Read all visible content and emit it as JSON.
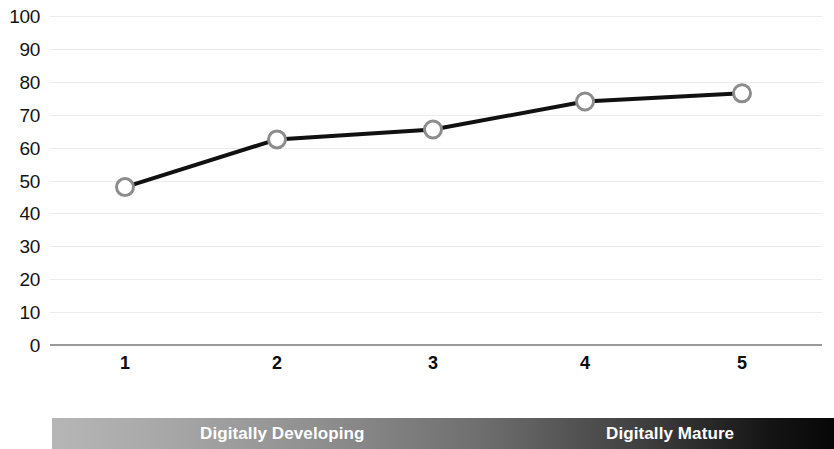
{
  "chart_data": {
    "type": "line",
    "title": "",
    "subtitle": "",
    "xlabel": "",
    "ylabel": "",
    "x": [
      1,
      2,
      3,
      4,
      5
    ],
    "categories": [
      "1",
      "2",
      "3",
      "4",
      "5"
    ],
    "values": [
      48,
      62.5,
      65.5,
      74,
      76.5
    ],
    "series": [
      {
        "name": "",
        "values": [
          48,
          62.5,
          65.5,
          74,
          76.5
        ]
      }
    ],
    "ylim": [
      0,
      100
    ],
    "yticks": [
      0,
      10,
      20,
      30,
      40,
      50,
      60,
      70,
      80,
      90,
      100
    ],
    "ytick_labels": [
      "0",
      "10",
      "20",
      "30",
      "40",
      "50",
      "60",
      "70",
      "80",
      "90",
      "100"
    ],
    "xtick_labels": [
      "1",
      "2",
      "3",
      "4",
      "5"
    ],
    "grid": true,
    "grid_axis": "y",
    "legend": false,
    "legend_position": "none",
    "marker": "circle-open",
    "line_color": "#111111",
    "marker_fill": "#ffffff",
    "marker_edge": "#8c8c8c",
    "grid_color": "#ececec",
    "axis_color": "#9a9a9a",
    "annotations": [
      {
        "text": "Digitally Developing",
        "position": "bottom-left"
      },
      {
        "text": "Digitally Mature",
        "position": "bottom-right"
      }
    ]
  },
  "maturity_bar": {
    "left_label": "Digitally Developing",
    "right_label": "Digitally Mature",
    "gradient_start": "#b6b6b6",
    "gradient_end": "#070707",
    "text_color": "#ffffff"
  }
}
